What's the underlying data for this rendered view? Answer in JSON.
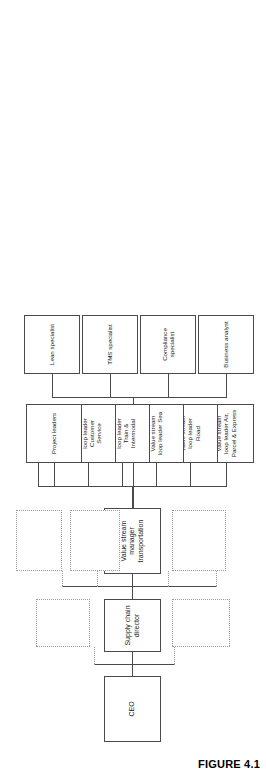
{
  "figure": {
    "caption": "FIGURE 4.1"
  },
  "chart_data": {
    "type": "diagram",
    "subtype": "organizational-chart",
    "orientation": "rotated-90-counterclockwise",
    "title": "",
    "nodes": [
      {
        "id": "ceo",
        "label": "CEO",
        "level": 0,
        "style": "solid"
      },
      {
        "id": "scd",
        "label": "Supply chain director",
        "level": 1,
        "style": "solid"
      },
      {
        "id": "vsm",
        "label": "Value stream manager\ntransportation",
        "level": 2,
        "style": "solid"
      },
      {
        "id": "peer-a",
        "label": "",
        "level": 1,
        "style": "dashed"
      },
      {
        "id": "peer-b",
        "label": "",
        "level": 1,
        "style": "dashed"
      },
      {
        "id": "peer-c",
        "label": "",
        "level": 2,
        "style": "dashed"
      },
      {
        "id": "peer-d",
        "label": "",
        "level": 2,
        "style": "dashed"
      },
      {
        "id": "peer-e",
        "label": "",
        "level": 2,
        "style": "dashed"
      },
      {
        "id": "leaf-1",
        "label": "Value stream\nloop leader Air,\nParcel & Express",
        "level": 3,
        "style": "solid"
      },
      {
        "id": "leaf-2",
        "label": "Value stream\nloop leader\nRoad",
        "level": 3,
        "style": "solid"
      },
      {
        "id": "leaf-3",
        "label": "Value stream\nloop leader Sea",
        "level": 3,
        "style": "solid"
      },
      {
        "id": "leaf-4",
        "label": "Value stream\nloop leader\nTrain &\nIntermodal",
        "level": 3,
        "style": "solid"
      },
      {
        "id": "leaf-5",
        "label": "Value stream\nloop leader\nCustomer\nService",
        "level": 3,
        "style": "solid"
      },
      {
        "id": "leaf-6",
        "label": "Project leaders",
        "level": 3,
        "style": "solid"
      },
      {
        "id": "leaf-7",
        "label": "Business analyst",
        "level": 3,
        "style": "solid"
      },
      {
        "id": "leaf-8",
        "label": "Compliance\nspecialist",
        "level": 3,
        "style": "solid"
      },
      {
        "id": "leaf-9",
        "label": "TMS specialist",
        "level": 3,
        "style": "solid"
      },
      {
        "id": "leaf-10",
        "label": "Lean specialist",
        "level": 3,
        "style": "solid"
      }
    ],
    "edges": [
      {
        "from": "ceo",
        "to": "scd",
        "style": "solid"
      },
      {
        "from": "ceo",
        "to": "peer-a",
        "style": "dashed"
      },
      {
        "from": "ceo",
        "to": "peer-b",
        "style": "dashed"
      },
      {
        "from": "scd",
        "to": "vsm",
        "style": "solid"
      },
      {
        "from": "scd",
        "to": "peer-c",
        "style": "dashed"
      },
      {
        "from": "scd",
        "to": "peer-d",
        "style": "dashed"
      },
      {
        "from": "scd",
        "to": "peer-e",
        "style": "dashed"
      },
      {
        "from": "vsm",
        "to": "leaf-1",
        "style": "solid"
      },
      {
        "from": "vsm",
        "to": "leaf-2",
        "style": "solid"
      },
      {
        "from": "vsm",
        "to": "leaf-3",
        "style": "solid"
      },
      {
        "from": "vsm",
        "to": "leaf-4",
        "style": "solid"
      },
      {
        "from": "vsm",
        "to": "leaf-5",
        "style": "solid"
      },
      {
        "from": "vsm",
        "to": "leaf-6",
        "style": "solid"
      },
      {
        "from": "vsm",
        "to": "leaf-7",
        "style": "solid"
      },
      {
        "from": "vsm",
        "to": "leaf-8",
        "style": "solid"
      },
      {
        "from": "vsm",
        "to": "leaf-9",
        "style": "solid"
      },
      {
        "from": "vsm",
        "to": "leaf-10",
        "style": "solid"
      }
    ],
    "colors": {
      "solid_border": "#4a4a4a",
      "dashed_border": "#9a9a9a",
      "background": "#ffffff",
      "text": "#1a1a1a"
    }
  }
}
